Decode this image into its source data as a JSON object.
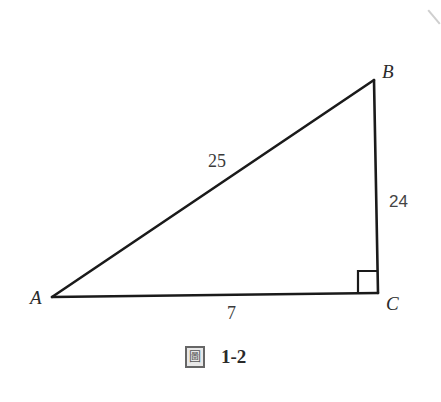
{
  "figure": {
    "type": "right-triangle",
    "vertices": [
      {
        "name": "A",
        "x": 52,
        "y": 297
      },
      {
        "name": "B",
        "x": 374,
        "y": 80
      },
      {
        "name": "C",
        "x": 378,
        "y": 293
      }
    ],
    "right_angle_at": "C",
    "line_color": "#1a1a1a"
  },
  "labels": {
    "vertex_a": "A",
    "vertex_b": "B",
    "vertex_c": "C",
    "side_ab": "25",
    "side_bc": "24",
    "side_ac": "7"
  },
  "caption": {
    "prefix": "圖",
    "number": "1-2"
  }
}
